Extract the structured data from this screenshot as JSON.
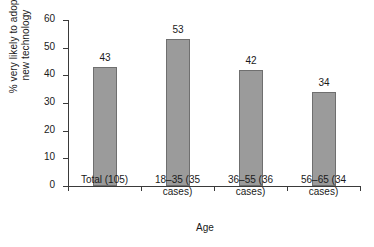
{
  "chart_data": {
    "type": "bar",
    "title": "",
    "subtitle": "",
    "categories": [
      "Total (105)",
      "18–35 (35 cases)",
      "36–55 (36 cases)",
      "56–65 (34 cases)"
    ],
    "category_lines": [
      [
        "Total (105)"
      ],
      [
        "18–35 (35",
        "cases)"
      ],
      [
        "36–55 (36",
        "cases)"
      ],
      [
        "56–65 (34",
        "cases)"
      ]
    ],
    "values": [
      43,
      53,
      42,
      34
    ],
    "data_labels": [
      "43",
      "53",
      "42",
      "34"
    ],
    "xlabel": "Age",
    "ylabel_lines": [
      "% very likely to adopt",
      "new technology"
    ],
    "ylabel": "% very likely to adopt new technology",
    "ylim": [
      0,
      60
    ],
    "yticks": [
      0,
      10,
      20,
      30,
      40,
      50,
      60
    ],
    "ytick_labels": [
      "0",
      "10",
      "20",
      "30",
      "40",
      "50",
      "60"
    ],
    "grid": false,
    "legend": false,
    "legend_position": "none",
    "bar_color": "#9b9b9b",
    "bar_edge_color": "#6f6f6f",
    "axis_color": "#3a3a3a",
    "background_color": "#ffffff"
  }
}
